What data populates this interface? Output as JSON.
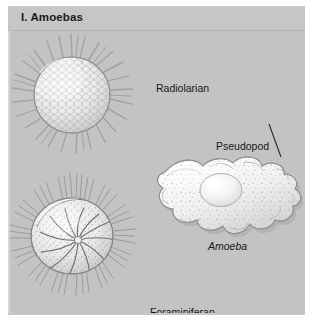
{
  "figure": {
    "title": "I. Amoebas",
    "background_color": "#c6c6c6",
    "stage_color": "#c3c3c3",
    "text_color": "#17171a"
  },
  "labels": {
    "radiolarian": "Radiolarian",
    "pseudopod": "Pseudopod",
    "amoeba": "Amoeba",
    "foraminiferan": "Foraminiferan"
  },
  "organisms": [
    {
      "name": "Radiolarian",
      "description": "Spherical silica test with honeycomb lattice and radiating spines"
    },
    {
      "name": "Amoeba",
      "description": "Irregular cell with lobed pseudopods, large oval nucleus and granular cytoplasm"
    },
    {
      "name": "Foraminiferan",
      "description": "Spiral chambered calcareous test with fine radiating spines"
    }
  ],
  "annotations": [
    {
      "label": "Pseudopod",
      "points_to": "upper-right lobe of the amoeba"
    }
  ]
}
